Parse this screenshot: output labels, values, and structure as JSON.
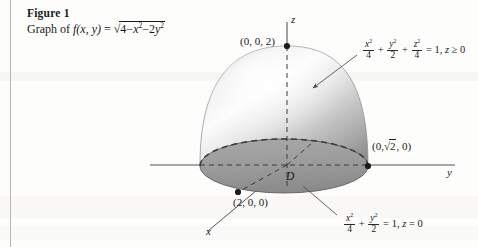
{
  "figure": {
    "caption_number": "Figure 1",
    "caption_prefix": "Graph of",
    "caption_function_name": "f(x, y)",
    "caption_equals": "=",
    "caption_radicand_lead": "4",
    "caption_minus1": "−",
    "caption_x": "x",
    "caption_exp2_a": "2",
    "caption_minus2": "−",
    "caption_coef2": "2",
    "caption_y": "y",
    "caption_exp2_b": "2"
  },
  "axes": {
    "z_label": "z",
    "y_label": "y",
    "x_label": "x"
  },
  "points": {
    "apex": "(0, 0, 2)",
    "y_intercept_prefix": "(0,",
    "y_intercept_radicand": "2",
    "y_intercept_suffix": ", 0)",
    "x_intercept": "(2, 0, 0)"
  },
  "region": {
    "label": "D"
  },
  "equations": {
    "surface": {
      "term1_num": "x",
      "term1_num_exp": "2",
      "term1_den": "4",
      "plus1": "+",
      "term2_num": "y",
      "term2_num_exp": "2",
      "term2_den": "2",
      "plus2": "+",
      "term3_num": "z",
      "term3_num_exp": "2",
      "term3_den": "4",
      "equals": "= 1,",
      "condition_var": "z",
      "condition_rel": "≥ 0"
    },
    "base": {
      "term1_num": "x",
      "term1_num_exp": "2",
      "term1_den": "4",
      "plus1": "+",
      "term2_num": "y",
      "term2_num_exp": "2",
      "term2_den": "2",
      "equals": "= 1,",
      "condition_var": "z",
      "condition_rel": "= 0"
    }
  },
  "colors": {
    "axis": "#555555",
    "dome_light": "#fdfdfd",
    "dome_mid": "#d8d8d8",
    "dome_dark": "#9a9a9a",
    "base_fill": "#9d9d9d",
    "base_front_fill": "#8f8f8f",
    "outline": "#3a3a3a",
    "margin_rule": "#b9b7b4"
  }
}
